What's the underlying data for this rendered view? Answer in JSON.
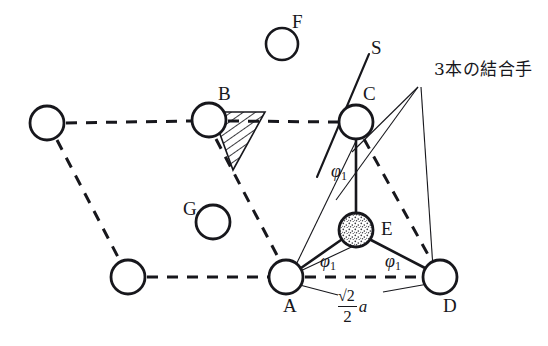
{
  "figure": {
    "title": "3本の結合手",
    "background_color": "#ffffff",
    "line_color": "#17171c",
    "atom_fill_open": "#ffffff",
    "atom_fill_stippled": "#e8e8e8",
    "hatch_color": "#17171c"
  },
  "atoms": [
    {
      "id": "atom-top-left",
      "label": "",
      "cx": 47,
      "cy": 123,
      "r": 17,
      "fill": "open"
    },
    {
      "id": "atom-B",
      "label": "B",
      "cx": 209,
      "cy": 120,
      "r": 17,
      "fill": "open"
    },
    {
      "id": "atom-F",
      "label": "F",
      "cx": 282,
      "cy": 44,
      "r": 16,
      "fill": "open"
    },
    {
      "id": "atom-C",
      "label": "C",
      "cx": 356,
      "cy": 122,
      "r": 17,
      "fill": "open"
    },
    {
      "id": "atom-G",
      "label": "G",
      "cx": 213,
      "cy": 222,
      "r": 17,
      "fill": "open"
    },
    {
      "id": "atom-E",
      "label": "E",
      "cx": 356,
      "cy": 230,
      "r": 17,
      "fill": "stippled"
    },
    {
      "id": "atom-bottom-left",
      "label": "",
      "cx": 128,
      "cy": 277,
      "r": 17,
      "fill": "open"
    },
    {
      "id": "atom-A",
      "label": "A",
      "cx": 286,
      "cy": 277,
      "r": 17,
      "fill": "open"
    },
    {
      "id": "atom-D",
      "label": "D",
      "cx": 440,
      "cy": 277,
      "r": 17,
      "fill": "open"
    }
  ],
  "labels": {
    "B": "B",
    "F": "F",
    "C": "C",
    "G": "G",
    "E": "E",
    "A": "A",
    "D": "D",
    "S": "S",
    "bonds_note": "3本の結合手",
    "phi_symbol": "φ",
    "phi_subscript": "1",
    "length_numerator": "√2",
    "length_denominator": "2",
    "length_variable": "a"
  },
  "angle_labels": [
    {
      "id": "phi-top",
      "symbol": "φ",
      "sub": "1",
      "x": 331,
      "y": 170
    },
    {
      "id": "phi-bottom-left",
      "symbol": "φ",
      "sub": "1",
      "x": 320,
      "y": 260
    },
    {
      "id": "phi-bottom-right",
      "symbol": "φ",
      "sub": "1",
      "x": 385,
      "y": 260
    }
  ],
  "annotations": {
    "bonds_note_x": 434,
    "bonds_note_y": 69,
    "s_label_x": 371,
    "s_label_y": 46,
    "length_label_x": 338,
    "length_label_y": 292
  }
}
